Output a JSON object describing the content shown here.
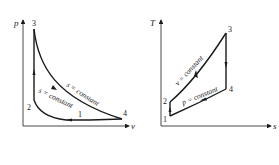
{
  "diagrams": [
    {
      "name": "p-v diagram",
      "axes": {
        "y_label": "p",
        "x_label": "v"
      },
      "points": {
        "p1": "1",
        "p2": "2",
        "p3": "3",
        "p4": "4"
      },
      "curves": {
        "upper": "s = constant",
        "lower": "s = constant"
      }
    },
    {
      "name": "T-s diagram",
      "axes": {
        "y_label": "T",
        "x_label": "s"
      },
      "points": {
        "p1": "1",
        "p2": "2",
        "p3": "3",
        "p4": "4"
      },
      "curves": {
        "upper": "v = constant",
        "lower": "p = constant"
      }
    }
  ],
  "colors": {
    "line": "#1a1a1a",
    "text": "#222222",
    "background": "#ffffff"
  }
}
